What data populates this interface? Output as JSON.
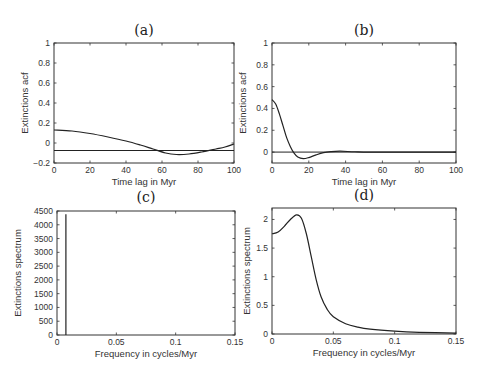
{
  "chart_data": [
    {
      "panel": "(a)",
      "type": "line",
      "title": "(a)",
      "xlabel": "Time lag in Myr",
      "ylabel": "Extinctions acf",
      "xlim": [
        0,
        100
      ],
      "ylim": [
        -0.2,
        1
      ],
      "xticks": [
        "0",
        "20",
        "40",
        "60",
        "80",
        "100"
      ],
      "yticks": [
        "-0.2",
        "0",
        "0.2",
        "0.4",
        "0.6",
        "0.8",
        "1"
      ],
      "grid": false,
      "series": [
        {
          "name": "acf",
          "x": [
            0,
            10,
            20,
            30,
            40,
            48,
            55,
            62,
            68,
            75,
            82,
            90,
            95,
            100
          ],
          "values": [
            0.13,
            0.12,
            0.095,
            0.06,
            0.02,
            -0.02,
            -0.06,
            -0.1,
            -0.115,
            -0.11,
            -0.09,
            -0.06,
            -0.04,
            -0.01
          ]
        },
        {
          "name": "reference line",
          "x": [
            0,
            100
          ],
          "values": [
            -0.075,
            -0.075
          ]
        }
      ]
    },
    {
      "panel": "(b)",
      "type": "line",
      "title": "(b)",
      "xlabel": "Time lag in Myr",
      "ylabel": "Extinctions acf",
      "xlim": [
        0,
        100
      ],
      "ylim": [
        -0.1,
        1
      ],
      "xticks": [
        "0",
        "20",
        "40",
        "60",
        "80",
        "100"
      ],
      "yticks": [
        "0",
        "0.2",
        "0.4",
        "0.6",
        "0.8",
        "1"
      ],
      "grid": false,
      "series": [
        {
          "name": "acf",
          "x": [
            0,
            2,
            4,
            6,
            8,
            10,
            12,
            14,
            17,
            20,
            24,
            28,
            32,
            37,
            45,
            55,
            100
          ],
          "values": [
            0.48,
            0.44,
            0.35,
            0.24,
            0.13,
            0.05,
            -0.01,
            -0.045,
            -0.06,
            -0.05,
            -0.025,
            -0.005,
            0.004,
            0.008,
            0.003,
            0.0,
            0.0
          ]
        },
        {
          "name": "zero line",
          "x": [
            0,
            100
          ],
          "values": [
            0,
            0
          ]
        }
      ]
    },
    {
      "panel": "(c)",
      "type": "line",
      "title": "(c)",
      "xlabel": "Frequency in cycles/Myr",
      "ylabel": "Extinctions spectrum",
      "xlim": [
        0,
        0.15
      ],
      "ylim": [
        0,
        4500
      ],
      "xticks": [
        "0",
        "0.05",
        "0.1",
        "0.15"
      ],
      "yticks": [
        "0",
        "500",
        "1000",
        "1500",
        "2000",
        "2500",
        "3000",
        "3500",
        "4000",
        "4500"
      ],
      "grid": false,
      "series": [
        {
          "name": "spectrum",
          "x": [
            0.0075,
            0.0075
          ],
          "values": [
            0,
            4380
          ]
        }
      ]
    },
    {
      "panel": "(d)",
      "type": "line",
      "title": "(d)",
      "xlabel": "Frequency in cycles/Myr",
      "ylabel": "Extinctions spectrum",
      "xlim": [
        0,
        0.15
      ],
      "ylim": [
        0,
        2.2
      ],
      "xticks": [
        "0",
        "0.05",
        "0.1",
        "0.15"
      ],
      "yticks": [
        "0",
        "0.5",
        "1",
        "1.5",
        "2"
      ],
      "grid": false,
      "series": [
        {
          "name": "spectrum",
          "x": [
            0,
            0.005,
            0.01,
            0.015,
            0.02,
            0.024,
            0.028,
            0.032,
            0.036,
            0.04,
            0.045,
            0.05,
            0.06,
            0.07,
            0.08,
            0.1,
            0.12,
            0.15
          ],
          "values": [
            1.75,
            1.78,
            1.88,
            2.0,
            2.08,
            2.02,
            1.75,
            1.35,
            0.95,
            0.65,
            0.43,
            0.3,
            0.18,
            0.12,
            0.085,
            0.05,
            0.03,
            0.015
          ]
        }
      ]
    }
  ],
  "labels": {
    "a": {
      "title": "(a)",
      "xlabel": "Time lag in Myr",
      "ylabel": "Extinctions acf"
    },
    "b": {
      "title": "(b)",
      "xlabel": "Time lag in Myr",
      "ylabel": "Extinctions acf"
    },
    "c": {
      "title": "(c)",
      "xlabel": "Frequency in cycles/Myr",
      "ylabel": "Extinctions spectrum"
    },
    "d": {
      "title": "(d)",
      "xlabel": "Frequency in cycles/Myr",
      "ylabel": "Extinctions spectrum"
    }
  }
}
